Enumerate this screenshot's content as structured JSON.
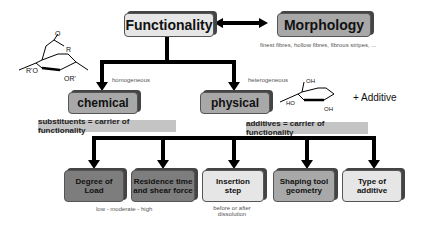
{
  "top": {
    "functionality": "Functionality",
    "morphology": "Morphology",
    "morphology_note": "finest fibres, hollow fibres, fibrous stripes, ..."
  },
  "branches": {
    "chemical": {
      "label": "chemical",
      "note": "homogeneous",
      "band": "substituents = carrier of functionality"
    },
    "physical": {
      "label": "physical",
      "note": "heterogeneous",
      "band": "additives = carrier of functionality",
      "additive": "+ Additive"
    }
  },
  "leaves": [
    {
      "line1": "Degree of",
      "line2": "Load",
      "note": "low - moderate - high"
    },
    {
      "line1": "Residence time",
      "line2": "and shear force",
      "note": ""
    },
    {
      "line1": "Insertion",
      "line2": "step",
      "note": "before or after dissolution"
    },
    {
      "line1": "Shaping tool",
      "line2": "geometry",
      "note": ""
    },
    {
      "line1": "Type of",
      "line2": "additive",
      "note": ""
    }
  ],
  "molecule_labels": {
    "left": {
      "o1": "O",
      "r": "R",
      "o2": "O",
      "o3": "O",
      "ro": "R'O",
      "or": "OR'"
    },
    "right": {
      "oh_top": "OH",
      "ho": "HO",
      "oh_bottom": "OH",
      "o_ring": "O",
      "o_tail": "O"
    }
  }
}
